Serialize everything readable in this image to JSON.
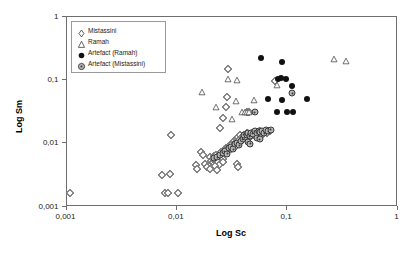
{
  "chart_data": {
    "type": "scatter",
    "title": "",
    "xlabel": "Log Sc",
    "ylabel": "Log Sm",
    "xscale": "log",
    "yscale": "log",
    "xlim": [
      0.001,
      1
    ],
    "ylim": [
      0.001,
      1
    ],
    "xticks": [
      "0,001",
      "0,01",
      "0,1",
      "1"
    ],
    "yticks": [
      "1",
      "0,1",
      "0,01",
      "0,001"
    ],
    "grid": false,
    "legend_position": "top-left",
    "legend": [
      {
        "label": "Mistassini",
        "marker": "open-diamond"
      },
      {
        "label": "Ramah",
        "marker": "open-triangle"
      },
      {
        "label": "Artefact (Ramah)",
        "marker": "filled-circle"
      },
      {
        "label": "Artefact (Mistassini)",
        "marker": "gray-circle"
      }
    ],
    "series": [
      {
        "name": "Mistassini",
        "marker": "open-diamond",
        "points": [
          [
            0.0011,
            0.0016
          ],
          [
            0.0075,
            0.003
          ],
          [
            0.0088,
            0.0031
          ],
          [
            0.008,
            0.0016
          ],
          [
            0.0085,
            0.0016
          ],
          [
            0.0105,
            0.0016
          ],
          [
            0.009,
            0.0128
          ],
          [
            0.0152,
            0.0043
          ],
          [
            0.0155,
            0.0038
          ],
          [
            0.017,
            0.007
          ],
          [
            0.0178,
            0.0062
          ],
          [
            0.0185,
            0.0045
          ],
          [
            0.0192,
            0.004
          ],
          [
            0.0205,
            0.0058
          ],
          [
            0.0208,
            0.005
          ],
          [
            0.0215,
            0.0048
          ],
          [
            0.0218,
            0.0055
          ],
          [
            0.0222,
            0.006
          ],
          [
            0.0228,
            0.0052
          ],
          [
            0.0232,
            0.0062
          ],
          [
            0.0238,
            0.0057
          ],
          [
            0.0242,
            0.0048
          ],
          [
            0.0248,
            0.0044
          ],
          [
            0.0252,
            0.0065
          ],
          [
            0.0258,
            0.007
          ],
          [
            0.0262,
            0.006
          ],
          [
            0.0268,
            0.0055
          ],
          [
            0.0272,
            0.0075
          ],
          [
            0.0278,
            0.0068
          ],
          [
            0.0282,
            0.008
          ],
          [
            0.0288,
            0.0072
          ],
          [
            0.025,
            0.017
          ],
          [
            0.027,
            0.0245
          ],
          [
            0.0285,
            0.0355
          ],
          [
            0.029,
            0.052
          ],
          [
            0.0295,
            0.145
          ],
          [
            0.03,
            0.0085
          ],
          [
            0.031,
            0.009
          ],
          [
            0.0318,
            0.0078
          ],
          [
            0.0325,
            0.0095
          ],
          [
            0.0335,
            0.0105
          ],
          [
            0.0342,
            0.0098
          ],
          [
            0.035,
            0.0088
          ],
          [
            0.0358,
            0.0112
          ],
          [
            0.0368,
            0.012
          ],
          [
            0.0375,
            0.0108
          ],
          [
            0.0385,
            0.013
          ],
          [
            0.0395,
            0.0122
          ],
          [
            0.0405,
            0.0115
          ],
          [
            0.0418,
            0.0132
          ],
          [
            0.0428,
            0.0125
          ],
          [
            0.044,
            0.0138
          ],
          [
            0.0452,
            0.0128
          ],
          [
            0.0465,
            0.0118
          ],
          [
            0.0478,
            0.0135
          ],
          [
            0.049,
            0.0142
          ],
          [
            0.044,
            0.0295
          ],
          [
            0.0465,
            0.03
          ],
          [
            0.0355,
            0.0045
          ],
          [
            0.0365,
            0.004
          ],
          [
            0.0502,
            0.013
          ],
          [
            0.0518,
            0.014
          ],
          [
            0.0532,
            0.0125
          ],
          [
            0.0548,
            0.0145
          ],
          [
            0.0565,
            0.0135
          ],
          [
            0.0585,
            0.015
          ],
          [
            0.06,
            0.0128
          ],
          [
            0.062,
            0.0142
          ],
          [
            0.064,
            0.015
          ],
          [
            0.0665,
            0.014
          ],
          [
            0.0695,
            0.0152
          ],
          [
            0.072,
            0.0148
          ],
          [
            0.08,
            0.092
          ],
          [
            0.027,
            0.0048
          ],
          [
            0.0228,
            0.0042
          ],
          [
            0.0238,
            0.0036
          ],
          [
            0.0205,
            0.0038
          ]
        ]
      },
      {
        "name": "Ramah",
        "marker": "open-triangle",
        "points": [
          [
            0.0172,
            0.063
          ],
          [
            0.0232,
            0.0358
          ],
          [
            0.0298,
            0.099
          ],
          [
            0.0358,
            0.0965
          ],
          [
            0.0348,
            0.045
          ],
          [
            0.04,
            0.03
          ],
          [
            0.042,
            0.03
          ],
          [
            0.044,
            0.03
          ],
          [
            0.0462,
            0.03
          ],
          [
            0.0322,
            0.0228
          ],
          [
            0.0515,
            0.046
          ],
          [
            0.0825,
            0.08
          ],
          [
            0.27,
            0.208
          ],
          [
            0.35,
            0.19
          ]
        ]
      },
      {
        "name": "Artefact (Ramah)",
        "marker": "filled-circle",
        "points": [
          [
            0.059,
            0.21
          ],
          [
            0.091,
            0.185
          ],
          [
            0.0845,
            0.1
          ],
          [
            0.089,
            0.102
          ],
          [
            0.0995,
            0.1
          ],
          [
            0.112,
            0.076
          ],
          [
            0.092,
            0.047
          ],
          [
            0.154,
            0.048
          ],
          [
            0.082,
            0.03
          ],
          [
            0.102,
            0.03
          ],
          [
            0.116,
            0.03
          ],
          [
            0.068,
            0.048
          ]
        ]
      },
      {
        "name": "Artefact (Mistassini)",
        "marker": "gray-circle",
        "points": [
          [
            0.0222,
            0.0056
          ],
          [
            0.0238,
            0.0058
          ],
          [
            0.0252,
            0.0062
          ],
          [
            0.0265,
            0.0068
          ],
          [
            0.0278,
            0.0072
          ],
          [
            0.0292,
            0.0066
          ],
          [
            0.0305,
            0.008
          ],
          [
            0.0318,
            0.0085
          ],
          [
            0.0332,
            0.0078
          ],
          [
            0.0345,
            0.0092
          ],
          [
            0.036,
            0.0098
          ],
          [
            0.0375,
            0.009
          ],
          [
            0.039,
            0.0105
          ],
          [
            0.0405,
            0.0112
          ],
          [
            0.042,
            0.012
          ],
          [
            0.0412,
            0.0132
          ],
          [
            0.0438,
            0.0128
          ],
          [
            0.0452,
            0.0138
          ],
          [
            0.0468,
            0.0125
          ],
          [
            0.0485,
            0.0142
          ],
          [
            0.05,
            0.0135
          ],
          [
            0.0448,
            0.01
          ],
          [
            0.0472,
            0.0095
          ],
          [
            0.052,
            0.0148
          ],
          [
            0.054,
            0.014
          ],
          [
            0.0562,
            0.0152
          ],
          [
            0.0585,
            0.0145
          ],
          [
            0.061,
            0.015
          ],
          [
            0.0635,
            0.0138
          ],
          [
            0.066,
            0.0155
          ],
          [
            0.069,
            0.015
          ],
          [
            0.0725,
            0.0158
          ],
          [
            0.0545,
            0.0118
          ],
          [
            0.0575,
            0.0112
          ],
          [
            0.113,
            0.059
          ],
          [
            0.052,
            0.0298
          ]
        ]
      }
    ]
  }
}
